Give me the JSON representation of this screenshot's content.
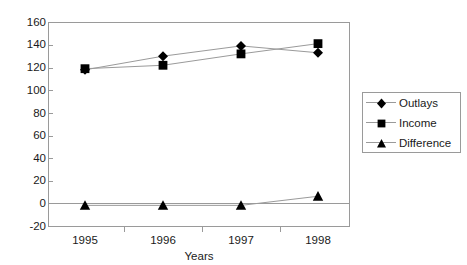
{
  "chart_data": {
    "type": "line",
    "title": "",
    "xlabel": "Years",
    "ylabel": "",
    "categories": [
      "1995",
      "1996",
      "1997",
      "1998"
    ],
    "x": [
      1995,
      1996,
      1997,
      1998
    ],
    "ylim": [
      -20,
      160
    ],
    "y_ticks": [
      160,
      140,
      120,
      100,
      80,
      60,
      40,
      20,
      0,
      -20
    ],
    "grid": false,
    "legend_position": "right",
    "series": [
      {
        "name": "Outlays",
        "marker": "diamond",
        "color": "#000000",
        "values": [
          118,
          130,
          139,
          133
        ]
      },
      {
        "name": "Income",
        "marker": "square",
        "color": "#000000",
        "values": [
          119,
          122,
          132,
          141
        ]
      },
      {
        "name": "Difference",
        "marker": "triangle",
        "color": "#000000",
        "values": [
          -1,
          -1,
          -1,
          7
        ]
      }
    ]
  },
  "axes": {
    "y_tick_labels": [
      "160",
      "140",
      "120",
      "100",
      "80",
      "60",
      "40",
      "20",
      "0",
      "-20"
    ],
    "x_tick_labels": [
      "1995",
      "1996",
      "1997",
      "1998"
    ],
    "x_axis_title": "Years"
  },
  "legend": {
    "entries": [
      {
        "label": "Outlays",
        "marker": "diamond-marker-icon"
      },
      {
        "label": "Income",
        "marker": "square-marker-icon"
      },
      {
        "label": "Difference",
        "marker": "triangle-marker-icon"
      }
    ]
  },
  "colors": {
    "axis": "#9a9a9a",
    "series": "#000000",
    "text": "#1a1a1a",
    "background": "#ffffff"
  }
}
